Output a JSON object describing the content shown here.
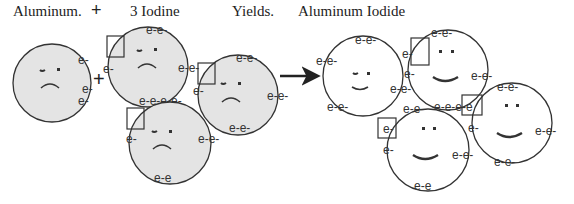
{
  "title_labels": {
    "reactant1": "Aluminum.",
    "plus1": "+",
    "reactant2": "3 Iodine",
    "yields": "Yields.",
    "product": "Aluminum Iodide"
  },
  "operators": {
    "plus_between": "+",
    "arrow": "yields-arrow"
  },
  "electron_label": "e-",
  "electron_pair_label": "e-e-",
  "colors": {
    "reactant_fill": "#e4e4e4",
    "product_fill": "#ffffff",
    "stroke": "#333333"
  },
  "reactants": [
    {
      "name": "aluminum-atom",
      "face": "sad",
      "electrons": [
        "e-",
        "e-",
        "e-"
      ]
    },
    {
      "name": "iodine-atom-1",
      "face": "sad",
      "electron_pairs": [
        "e-e-",
        "e-e-",
        "e-e-"
      ],
      "single": "e-",
      "vacancy_box": true
    },
    {
      "name": "iodine-atom-2",
      "face": "sad",
      "electron_pairs": [
        "e-e-",
        "e-e-",
        "e-e-"
      ],
      "single": "e-",
      "vacancy_box": true
    },
    {
      "name": "iodine-atom-3",
      "face": "sad",
      "electron_pairs": [
        "e-e-",
        "e-e-",
        "e-e-"
      ],
      "single": "e-",
      "vacancy_box": true
    }
  ],
  "products": [
    {
      "name": "aluminum-ion",
      "face": "happy",
      "electron_pairs": [
        "e-e-",
        "e-e-",
        "e-e-",
        "e-e-"
      ]
    },
    {
      "name": "iodide-ion-1",
      "face": "happy",
      "electron_pairs": [
        "e-e-",
        "e-e-",
        "e-e-",
        "e-e-"
      ],
      "vacancy_box": true
    },
    {
      "name": "iodide-ion-2",
      "face": "happy",
      "electron_pairs": [
        "e-e-",
        "e-e-",
        "e-e-",
        "e-e-"
      ],
      "vacancy_box": true
    },
    {
      "name": "iodide-ion-3",
      "face": "happy",
      "electron_pairs": [
        "e-e-",
        "e-e-",
        "e-e-",
        "e-e-"
      ],
      "vacancy_box": true
    }
  ]
}
